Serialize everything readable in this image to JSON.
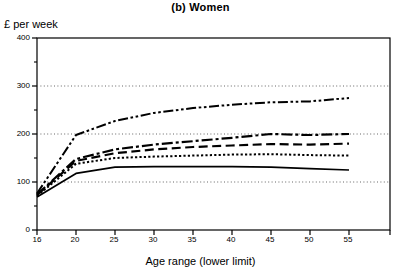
{
  "chart_data": {
    "type": "line",
    "title": "(b) Women",
    "xlabel": "Age range (lower limit)",
    "ylabel": "£ per week",
    "x": [
      16,
      20,
      25,
      30,
      35,
      40,
      45,
      50,
      55
    ],
    "categories": [
      "16",
      "20",
      "25",
      "30",
      "35",
      "40",
      "45",
      "50",
      "55"
    ],
    "xtick_labels": [
      "16",
      "20",
      "25",
      "30",
      "35",
      "40",
      "45",
      "50",
      "55"
    ],
    "ytick_labels": [
      "0",
      "100",
      "200",
      "300",
      "400"
    ],
    "yticks": [
      0,
      100,
      200,
      300,
      400
    ],
    "yticks_minor": [
      50,
      150,
      250,
      350
    ],
    "ylim": [
      0,
      400
    ],
    "grid": "horizontal dotted gridlines at 100, 200, 300",
    "gridlines": [
      100,
      200,
      300
    ],
    "legend": "none",
    "series": [
      {
        "name": "series-1",
        "style": "dash-dot-dot",
        "values": [
          76,
          198,
          227,
          244,
          254,
          261,
          266,
          268,
          275
        ]
      },
      {
        "name": "series-2",
        "style": "dash-dot",
        "values": [
          74,
          148,
          168,
          178,
          185,
          192,
          200,
          198,
          200
        ]
      },
      {
        "name": "series-3",
        "style": "long-dash",
        "values": [
          73,
          144,
          160,
          168,
          173,
          176,
          179,
          178,
          180
        ]
      },
      {
        "name": "series-4",
        "style": "fine-dotted",
        "values": [
          71,
          138,
          150,
          153,
          155,
          157,
          158,
          156,
          155
        ]
      },
      {
        "name": "series-5",
        "style": "solid",
        "values": [
          69,
          118,
          131,
          132,
          132,
          132,
          131,
          128,
          125
        ]
      }
    ]
  }
}
